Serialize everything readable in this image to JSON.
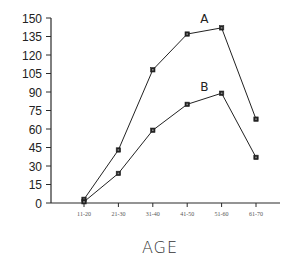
{
  "chart_data": {
    "type": "line",
    "title": "",
    "xlabel": "AGE",
    "ylabel": "",
    "categories": [
      "11-20",
      "21-30",
      "31-40",
      "41-50",
      "51-60",
      "61-70"
    ],
    "yticks": [
      0,
      15,
      30,
      45,
      60,
      75,
      90,
      105,
      120,
      135,
      150
    ],
    "ylim": [
      0,
      150
    ],
    "grid": false,
    "legend": "inline-labels",
    "series": [
      {
        "name": "A",
        "values": [
          3,
          43,
          108,
          137,
          142,
          68
        ]
      },
      {
        "name": "B",
        "values": [
          1,
          24,
          59,
          80,
          89,
          37
        ]
      }
    ]
  }
}
